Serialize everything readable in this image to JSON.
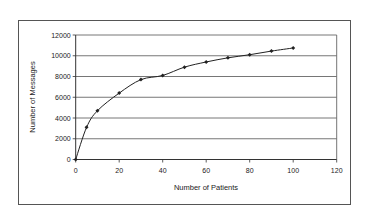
{
  "chart_data": {
    "type": "line",
    "title": "",
    "xlabel": "Number of Patients",
    "ylabel": "Number of Messages",
    "xlim": [
      0,
      120
    ],
    "ylim": [
      0,
      12000
    ],
    "x_ticks": [
      0,
      20,
      40,
      60,
      80,
      100,
      120
    ],
    "y_ticks": [
      0,
      2000,
      4000,
      6000,
      8000,
      10000,
      12000
    ],
    "grid": {
      "horizontal": true,
      "vertical": false
    },
    "legend": null,
    "series": [
      {
        "name": "Messages",
        "marker": "diamond",
        "color": "#222222",
        "x": [
          0,
          5,
          10,
          20,
          30,
          40,
          50,
          60,
          70,
          80,
          90,
          100
        ],
        "values": [
          0,
          3100,
          4700,
          6400,
          7700,
          8100,
          8900,
          9400,
          9800,
          10100,
          10450,
          10750
        ]
      }
    ]
  },
  "labels": {
    "x_axis_title": "Number of Patients",
    "y_axis_title": "Number of Messages"
  }
}
